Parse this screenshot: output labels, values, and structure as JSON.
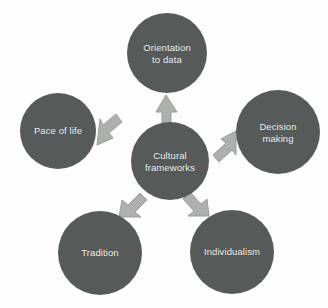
{
  "diagram": {
    "title": "Cultural frameworks",
    "type": "hub-and-spoke",
    "colors": {
      "background": "#fdfdfd",
      "node_fill": "#565b5a",
      "node_text": "#f2f2f0",
      "arrow_fill": "#adb0ac",
      "arrow_stroke": "#9a9d99"
    },
    "center": {
      "label": "Cultural\nframeworks",
      "cx": 170,
      "cy": 161,
      "r": 39
    },
    "nodes": [
      {
        "id": "orientation-to-data",
        "label": "Orientation\nto data",
        "cx": 167,
        "cy": 53,
        "r": 40,
        "direction": "up"
      },
      {
        "id": "decision-making",
        "label": "Decision\nmaking",
        "cx": 278,
        "cy": 132,
        "r": 42,
        "direction": "up-right"
      },
      {
        "id": "individualism",
        "label": "Individualism",
        "cx": 232,
        "cy": 252,
        "r": 42,
        "direction": "down-right"
      },
      {
        "id": "tradition",
        "label": "Tradition",
        "cx": 100,
        "cy": 253,
        "r": 42,
        "direction": "down-left"
      },
      {
        "id": "pace-of-life",
        "label": "Pace of life",
        "cx": 58,
        "cy": 131,
        "r": 38,
        "direction": "up-left"
      }
    ],
    "arrows": [
      {
        "id": "arrow-to-orientation",
        "target": "orientation-to-data",
        "points": "166,95 156,112 162,112 162,128 171,128 171,112 177,112",
        "rotate": 0
      },
      {
        "id": "arrow-to-decision",
        "target": "decision-making",
        "points": "236,131 221,139 226,143 213,155 219,162 232,150 236,155",
        "rotate": 0
      },
      {
        "id": "arrow-to-individualism",
        "target": "individualism",
        "points": "209,216 207,199 201,204 190,192 183,199 194,211 188,216",
        "rotate": 0
      },
      {
        "id": "arrow-to-tradition",
        "target": "tradition",
        "points": "119,217 122,200 128,205 140,193 147,200 135,212 141,217",
        "rotate": 0
      },
      {
        "id": "arrow-to-pace",
        "target": "pace-of-life",
        "points": "97,145 113,138 109,133 122,122 116,114 103,125 100,119",
        "rotate": 0
      }
    ]
  }
}
